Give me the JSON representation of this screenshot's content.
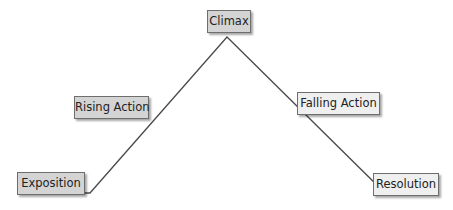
{
  "diagram": {
    "stages": {
      "exposition": "Exposition",
      "rising_action": "Rising Action",
      "climax": "Climax",
      "falling_action": "Falling Action",
      "resolution": "Resolution"
    },
    "colors": {
      "line": "#4a4a4a",
      "box_fill": "#d4d4d4",
      "box_fill_light": "#efefef",
      "box_border": "#6e6e6e"
    }
  }
}
